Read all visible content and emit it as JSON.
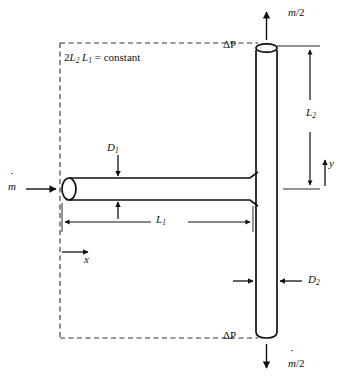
{
  "figure": {
    "type": "engineering-diagram",
    "background_color": "#ffffff",
    "line_color": "#111111"
  },
  "labels": {
    "constraint": "2L₂ L₁ = constant",
    "constraint_parts": {
      "coefficient": "2",
      "var_a": "L",
      "var_a_sub": "2",
      "var_b": "L",
      "var_b_sub": "1",
      "equals": "= constant"
    },
    "mass_flow_inlet": "ṁ",
    "mass_flow_branch_top": "ṁ/2",
    "mass_flow_branch_bottom": "ṁ/2",
    "pressure_drop_top": "ΔP",
    "pressure_drop_bottom": "ΔP",
    "length_horizontal": "L",
    "length_horizontal_sub": "1",
    "length_vertical": "L",
    "length_vertical_sub": "2",
    "diameter_horizontal": "D",
    "diameter_horizontal_sub": "1",
    "diameter_vertical": "D",
    "diameter_vertical_sub": "2",
    "axis_x": "x",
    "axis_y": "y"
  },
  "geometry": {
    "horizontal_pipe": {
      "x1": 62,
      "x2": 258,
      "y_top": 178,
      "y_bottom": 200
    },
    "vertical_pipe": {
      "y1": 44,
      "y2": 338,
      "x_left": 256,
      "x_right": 277
    },
    "dashed_boundary": {
      "x1": 60,
      "y1": 43,
      "x2": 258,
      "y2": 338
    }
  }
}
